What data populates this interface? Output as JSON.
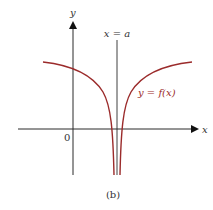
{
  "figure": {
    "caption": "(b)",
    "colors": {
      "axis": "#2a2a2a",
      "curve": "#9b2b2b",
      "text": "#333333",
      "background": "#ffffff"
    },
    "axes": {
      "x_label": "x",
      "y_label": "y",
      "origin_label": "0"
    },
    "asymptote": {
      "label": "x = a"
    },
    "curve": {
      "label": "y = f(x)",
      "description": "Function with vertical asymptote at x = a, approaching negative infinity from both sides"
    }
  }
}
